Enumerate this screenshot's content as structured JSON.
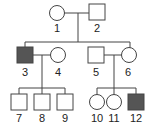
{
  "diagram": {
    "type": "pedigree",
    "colors": {
      "affected": "#555555",
      "line": "#444444",
      "unaffected": "#ffffff"
    },
    "individuals": [
      {
        "id": "1",
        "label": "1",
        "sex": "female",
        "affected": false,
        "generation": 1
      },
      {
        "id": "2",
        "label": "2",
        "sex": "male",
        "affected": false,
        "generation": 1
      },
      {
        "id": "3",
        "label": "3",
        "sex": "male",
        "affected": true,
        "generation": 2
      },
      {
        "id": "4",
        "label": "4",
        "sex": "female",
        "affected": false,
        "generation": 2
      },
      {
        "id": "5",
        "label": "5",
        "sex": "male",
        "affected": false,
        "generation": 2
      },
      {
        "id": "6",
        "label": "6",
        "sex": "female",
        "affected": false,
        "generation": 2
      },
      {
        "id": "7",
        "label": "7",
        "sex": "male",
        "affected": false,
        "generation": 3
      },
      {
        "id": "8",
        "label": "8",
        "sex": "male",
        "affected": false,
        "generation": 3
      },
      {
        "id": "9",
        "label": "9",
        "sex": "male",
        "affected": false,
        "generation": 3
      },
      {
        "id": "10",
        "label": "10",
        "sex": "female",
        "affected": false,
        "generation": 3
      },
      {
        "id": "11",
        "label": "11",
        "sex": "female",
        "affected": false,
        "generation": 3
      },
      {
        "id": "12",
        "label": "12",
        "sex": "male",
        "affected": true,
        "generation": 3
      }
    ],
    "couples": [
      [
        "1",
        "2"
      ],
      [
        "3",
        "4"
      ],
      [
        "5",
        "6"
      ]
    ],
    "children": {
      "1x2": [
        "3",
        "6"
      ],
      "3x4": [
        "7",
        "8",
        "9"
      ],
      "5x6": [
        "10",
        "11",
        "12"
      ]
    }
  }
}
